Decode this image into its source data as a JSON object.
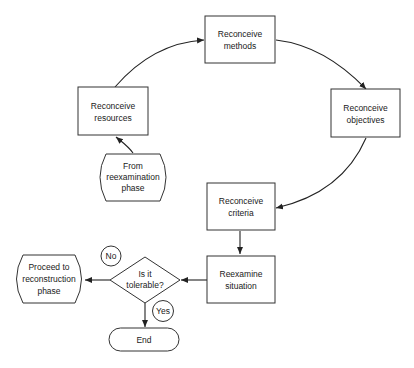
{
  "diagram": {
    "type": "flowchart",
    "nodes": {
      "methods": {
        "lines": [
          "Reconceive",
          "methods"
        ],
        "shape": "rectangle"
      },
      "objectives": {
        "lines": [
          "Reconceive",
          "objectives"
        ],
        "shape": "rectangle"
      },
      "resources": {
        "lines": [
          "Reconceive",
          "resources"
        ],
        "shape": "rectangle"
      },
      "from_reexam": {
        "lines": [
          "From",
          "reexamination",
          "phase"
        ],
        "shape": "off-page-connector"
      },
      "criteria": {
        "lines": [
          "Reconceive",
          "criteria"
        ],
        "shape": "rectangle"
      },
      "reexamine": {
        "lines": [
          "Reexamine",
          "situation"
        ],
        "shape": "rectangle"
      },
      "decision": {
        "lines": [
          "Is it",
          "tolerable?"
        ],
        "shape": "diamond"
      },
      "proceed": {
        "lines": [
          "Proceed to",
          "reconstruction",
          "phase"
        ],
        "shape": "off-page-connector"
      },
      "end": {
        "lines": [
          "End"
        ],
        "shape": "terminator"
      }
    },
    "edge_labels": {
      "no": "No",
      "yes": "Yes"
    },
    "edges": [
      {
        "from": "from_reexam",
        "to": "resources"
      },
      {
        "from": "resources",
        "to": "methods"
      },
      {
        "from": "methods",
        "to": "objectives"
      },
      {
        "from": "objectives",
        "to": "criteria"
      },
      {
        "from": "criteria",
        "to": "reexamine"
      },
      {
        "from": "reexamine",
        "to": "decision"
      },
      {
        "from": "decision",
        "to": "proceed",
        "label": "No"
      },
      {
        "from": "decision",
        "to": "end",
        "label": "Yes"
      }
    ]
  }
}
